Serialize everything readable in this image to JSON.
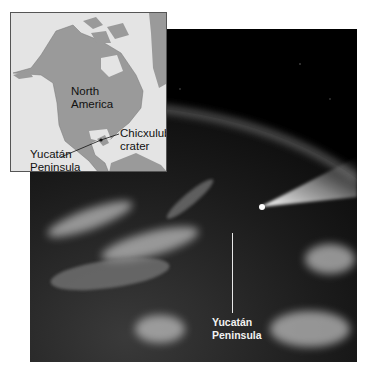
{
  "figure": {
    "inset_map": {
      "labels": {
        "continent": [
          "North",
          "America"
        ],
        "crater": [
          "Chicxulub",
          "crater"
        ],
        "peninsula": [
          "Yucatán",
          "Peninsula"
        ]
      },
      "colors": {
        "land": "#9a9a9a",
        "water": "#e4e4e4",
        "border": "#555555"
      }
    },
    "photo": {
      "description": "Satellite-style view of Earth with an incoming asteroid/comet streak near the Yucatán",
      "labels": {
        "peninsula": [
          "Yucatán",
          "Peninsula"
        ]
      },
      "colors": {
        "space": "#000000",
        "label": "#f2f2f2"
      }
    }
  }
}
